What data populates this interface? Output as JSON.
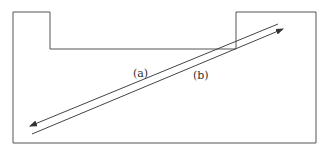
{
  "diagram": {
    "labels": {
      "a": "(a)",
      "b": "(b)"
    },
    "colors": {
      "stroke": "#444444",
      "background": "#ffffff"
    }
  }
}
